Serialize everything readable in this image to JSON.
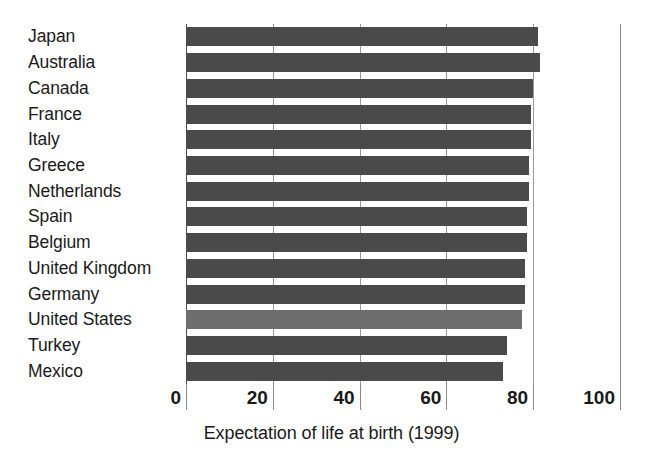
{
  "chart_data": {
    "type": "bar",
    "orientation": "horizontal",
    "title": "",
    "xlabel": "Expectation of life at birth (1999)",
    "ylabel": "",
    "xlim": [
      0,
      100
    ],
    "xticks": [
      0,
      20,
      40,
      60,
      80,
      100
    ],
    "xtick_labels": [
      "0",
      "20",
      "40",
      "60",
      "80",
      "100"
    ],
    "grid": true,
    "grid_axis": "x",
    "legend": "none",
    "categories": [
      "Japan",
      "Australia",
      "Canada",
      "France",
      "Italy",
      "Greece",
      "Netherlands",
      "Spain",
      "Belgium",
      "United Kingdom",
      "Germany",
      "United States",
      "Turkey",
      "Mexico"
    ],
    "values": [
      81.0,
      81.5,
      80.0,
      79.5,
      79.5,
      79.0,
      79.0,
      78.5,
      78.5,
      78.0,
      78.0,
      77.5,
      74.0,
      73.0
    ],
    "highlight_category": "United States",
    "colors": {
      "bar": "#4a4a4a",
      "bar_highlight": "#6e6e6e",
      "gridline": "#9a9a9a",
      "axis": "#4a4a4a",
      "text": "#1a1a1a",
      "background": "#ffffff"
    }
  },
  "axis": {
    "title": "Expectation of life at birth (1999)"
  }
}
